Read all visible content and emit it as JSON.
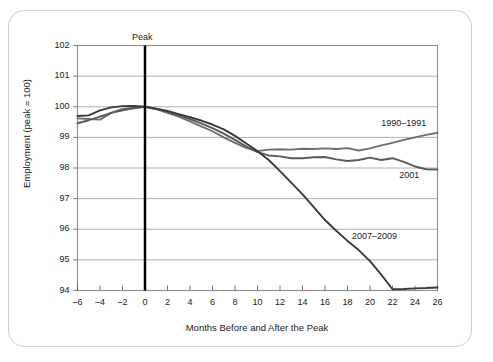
{
  "chart_data": {
    "type": "line",
    "title": "",
    "xlabel": "Months Before and After the Peak",
    "ylabel": "Employment (peak = 100)",
    "xlim": [
      -6,
      26
    ],
    "ylim": [
      94,
      102
    ],
    "xticks": [
      "–6",
      "–4",
      "–2",
      "0",
      "2",
      "4",
      "6",
      "8",
      "10",
      "12",
      "14",
      "16",
      "18",
      "20",
      "22",
      "24",
      "26"
    ],
    "xtick_values": [
      -6,
      -4,
      -2,
      0,
      2,
      4,
      6,
      8,
      10,
      12,
      14,
      16,
      18,
      20,
      22,
      24,
      26
    ],
    "yticks": [
      "94",
      "95",
      "96",
      "97",
      "98",
      "99",
      "100",
      "101",
      "102"
    ],
    "ytick_values": [
      94,
      95,
      96,
      97,
      98,
      99,
      100,
      101,
      102
    ],
    "grid": "horizontal",
    "legend_position": "inline-annotations",
    "annotations": [
      {
        "text": "Peak",
        "x": 0,
        "y": 102,
        "note": "label above vertical marker line at month 0"
      }
    ],
    "marker_line": {
      "x": 0,
      "color": "#000000",
      "width": 2.5
    },
    "x": [
      -6,
      -5,
      -4,
      -3,
      -2,
      -1,
      0,
      1,
      2,
      3,
      4,
      5,
      6,
      7,
      8,
      9,
      10,
      11,
      12,
      13,
      14,
      15,
      16,
      17,
      18,
      19,
      20,
      21,
      22,
      23,
      24,
      25,
      26
    ],
    "series": [
      {
        "name": "1990–1991",
        "color": "#6e6e6e",
        "label_x": 21.0,
        "label_y": 99.45,
        "values": [
          99.62,
          99.6,
          99.58,
          99.8,
          99.93,
          99.97,
          100.0,
          99.92,
          99.8,
          99.68,
          99.52,
          99.36,
          99.2,
          99.0,
          98.82,
          98.66,
          98.55,
          98.6,
          98.61,
          98.6,
          98.63,
          98.62,
          98.64,
          98.62,
          98.65,
          98.57,
          98.64,
          98.74,
          98.82,
          98.92,
          99.0,
          99.08,
          99.15
        ]
      },
      {
        "name": "2001",
        "color": "#5a5a5a",
        "label_x": 22.6,
        "label_y": 97.75,
        "values": [
          99.46,
          99.56,
          99.68,
          99.8,
          99.88,
          99.95,
          100.0,
          99.93,
          99.84,
          99.72,
          99.6,
          99.46,
          99.3,
          99.12,
          98.92,
          98.7,
          98.52,
          98.41,
          98.38,
          98.32,
          98.32,
          98.35,
          98.36,
          98.28,
          98.23,
          98.26,
          98.34,
          98.26,
          98.32,
          98.2,
          98.05,
          97.96,
          97.95
        ]
      },
      {
        "name": "2007–2009",
        "color": "#3a3a3a",
        "label_x": 18.4,
        "label_y": 95.75,
        "values": [
          99.7,
          99.72,
          99.88,
          99.98,
          100.02,
          100.03,
          100.0,
          99.94,
          99.86,
          99.76,
          99.66,
          99.55,
          99.42,
          99.26,
          99.05,
          98.8,
          98.55,
          98.26,
          97.9,
          97.52,
          97.14,
          96.72,
          96.3,
          95.95,
          95.62,
          95.32,
          94.96,
          94.52,
          94.04,
          94.05,
          94.07,
          94.08,
          94.1
        ]
      }
    ]
  }
}
